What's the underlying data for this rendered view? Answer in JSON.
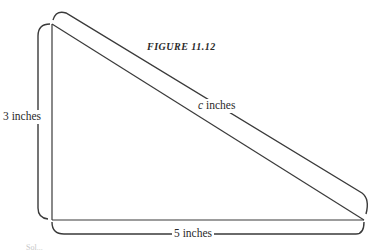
{
  "figure": {
    "title": "FIGURE 11.12",
    "labels": {
      "height": "3 inches",
      "hypotenuse_var": "c",
      "hypotenuse_unit": " inches",
      "base": "5 inches"
    },
    "footer_faint": "Sol..."
  },
  "colors": {
    "stroke": "#3a3a3a",
    "text": "#2a2a2a",
    "background": "#ffffff"
  }
}
